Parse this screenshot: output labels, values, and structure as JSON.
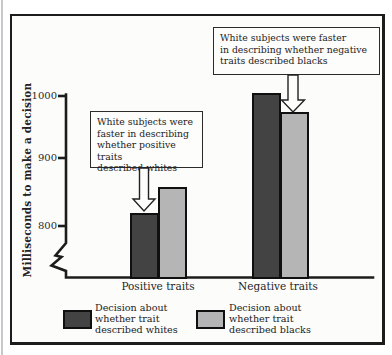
{
  "chart_data": {
    "type": "bar",
    "title": "",
    "categories": [
      "Positive traits",
      "Negative traits"
    ],
    "series": [
      {
        "name": "Decision about whether trait described whites",
        "color": "#434343",
        "values": [
          820,
          1005
        ]
      },
      {
        "name": "Decision about whether trait described blacks",
        "color": "#b5b5b5",
        "values": [
          860,
          975
        ]
      }
    ],
    "xlabel": "",
    "ylabel": "Milliseconds to make a decision",
    "yticks": [
      1000,
      900,
      800
    ],
    "ylim": [
      800,
      1010
    ],
    "axis_break_below": 800,
    "grid": false,
    "legend_position": "bottom"
  },
  "y_axis": {
    "title": "Milliseconds to make a decision",
    "ticks": [
      "1000",
      "900",
      "800"
    ]
  },
  "x_axis": {
    "categories": [
      "Positive traits",
      "Negative traits"
    ]
  },
  "annotations": {
    "positive": "White subjects were\nfaster in describing\nwhether positive traits\ndescribed whites",
    "negative": "White subjects were faster\nin describing whether negative\ntraits described blacks"
  },
  "legend": {
    "items": [
      {
        "label": "Decision about\nwhether trait\ndescribed whites",
        "color": "#434343"
      },
      {
        "label": "Decision about\nwhether trait\ndescribed blacks",
        "color": "#b5b5b5"
      }
    ]
  }
}
